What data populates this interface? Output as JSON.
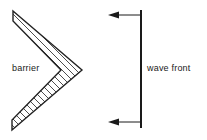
{
  "figure": {
    "background_color": "#ffffff",
    "width": 207,
    "height": 140,
    "labels": {
      "barrier": "barrier",
      "wave_front": "wave front"
    },
    "colors": {
      "ink": "#1a1a1a",
      "hatch": "#3a3a3a",
      "outline": "#222222"
    },
    "barrier": {
      "shape": "chevron",
      "apex_direction": "right",
      "fill": "hatched",
      "outer_points": "13,11 82,70 12,130",
      "inner_points": "13,21 61,70 12,120",
      "hatch_spacing_px": 5
    },
    "wave_front": {
      "orientation": "vertical",
      "x": 141,
      "y_top": 10,
      "y_bottom": 128,
      "line_width": 2
    },
    "arrows": [
      {
        "name": "top-direction-arrow",
        "direction": "left",
        "from_x": 140,
        "to_x": 108,
        "y": 15
      },
      {
        "name": "bottom-direction-arrow",
        "direction": "left",
        "from_x": 140,
        "to_x": 108,
        "y": 122
      }
    ]
  }
}
